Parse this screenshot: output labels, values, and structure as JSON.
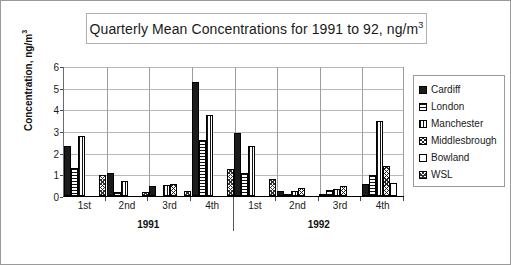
{
  "chart_data": {
    "type": "bar",
    "title": "Quarterly Mean Concentrations for 1991 to 92, ng/m3",
    "title_main": "Quarterly Mean Concentrations for 1991 to 92, ng/m",
    "title_sup": "3",
    "xlabel": "",
    "ylabel_main": "Concentration, ng/m",
    "ylabel_sup": "3",
    "ylim": [
      0,
      6
    ],
    "yticks": [
      6,
      5,
      4,
      3,
      2,
      1,
      0
    ],
    "grid": true,
    "legend_position": "right",
    "categories": [
      "1st",
      "2nd",
      "3rd",
      "4th",
      "1st",
      "2nd",
      "3rd",
      "4th"
    ],
    "group_labels": [
      "1991",
      "1992"
    ],
    "series": [
      {
        "name": "Cardiff",
        "pattern": "solid-black",
        "values": [
          2.3,
          1.08,
          0.46,
          5.25,
          2.93,
          0.25,
          0.08,
          0.55
        ]
      },
      {
        "name": "London",
        "pattern": "horizontal",
        "values": [
          1.3,
          0.2,
          0.0,
          2.6,
          1.08,
          0.1,
          0.27,
          0.95
        ]
      },
      {
        "name": "Manchester",
        "pattern": "vertical",
        "values": [
          2.78,
          0.68,
          0.52,
          3.75,
          2.32,
          0.25,
          0.33,
          3.45
        ]
      },
      {
        "name": "Middlesbrough",
        "pattern": "crosshatch",
        "values": [
          0.0,
          0.0,
          0.55,
          0.0,
          0.0,
          0.35,
          0.47,
          1.38
        ]
      },
      {
        "name": "Bowland",
        "pattern": "white",
        "values": [
          0.0,
          0.0,
          0.0,
          0.0,
          0.0,
          0.0,
          0.0,
          0.58
        ]
      },
      {
        "name": "WSL",
        "pattern": "dotted",
        "values": [
          0.95,
          0.2,
          0.21,
          1.25,
          0.77,
          0.0,
          0.0,
          0.0
        ]
      }
    ]
  },
  "legend": {
    "items": [
      {
        "label": "Cardiff",
        "pattern": "solid-black"
      },
      {
        "label": "London",
        "pattern": "horizontal"
      },
      {
        "label": "Manchester",
        "pattern": "vertical"
      },
      {
        "label": "Middlesbrough",
        "pattern": "crosshatch"
      },
      {
        "label": "Bowland",
        "pattern": "white"
      },
      {
        "label": "WSL",
        "pattern": "dotted"
      }
    ]
  },
  "colors": {
    "plot_background": "#ffffff",
    "frame_border": "#9a9a9a",
    "gridline": "#b8b8b8",
    "axis": "#000000",
    "bar_outline": "#000000",
    "bar_fill_dark": "#1b1b1b",
    "text": "#1a1a1a"
  }
}
